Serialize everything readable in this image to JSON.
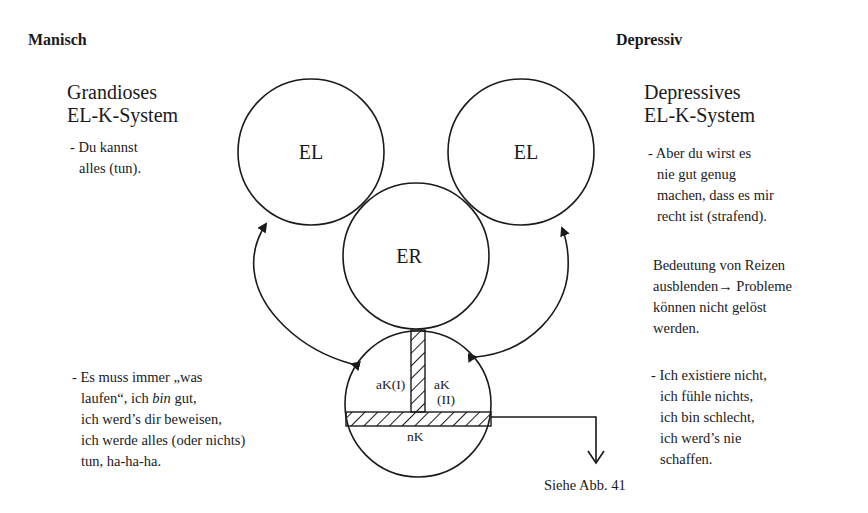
{
  "left": {
    "heading": "Manisch",
    "system_title": [
      "Grandioses",
      "EL-K-System"
    ],
    "top_quote": [
      "- Du kannst",
      "alles (tun)."
    ],
    "bottom_quote": {
      "line1": "- Es muss immer „was",
      "line2_pre": "laufen“, ich ",
      "line2_italic": "bin",
      "line2_post": " gut,",
      "line3": "ich werd’s dir beweisen,",
      "line4": "ich werde alles (oder nichts)",
      "line5": "tun, ha-ha-ha."
    }
  },
  "right": {
    "heading": "Depressiv",
    "system_title": [
      "Depressives",
      "EL-K-System"
    ],
    "top_quote": [
      "- Aber du wirst es",
      "nie gut genug",
      "machen, dass es mir",
      "recht ist (strafend)."
    ],
    "note": [
      "Bedeutung von Reizen",
      "ausblenden→ Probleme",
      "können nicht gelöst",
      "werden."
    ],
    "bottom_quote": [
      "- Ich existiere nicht,",
      "ich fühle nichts,",
      "ich bin schlecht,",
      "ich werd’s nie",
      "schaffen."
    ]
  },
  "diagram": {
    "circle_left_el": "EL",
    "circle_right_el": "EL",
    "circle_er": "ER",
    "k_circle": {
      "ak1": "aK(I)",
      "ak2": "aK",
      "ak2_sub": "(II)",
      "nk": "nK"
    },
    "reference": "Siehe Abb. 41"
  },
  "colors": {
    "ink": "#1a1a1a",
    "background": "#ffffff"
  }
}
